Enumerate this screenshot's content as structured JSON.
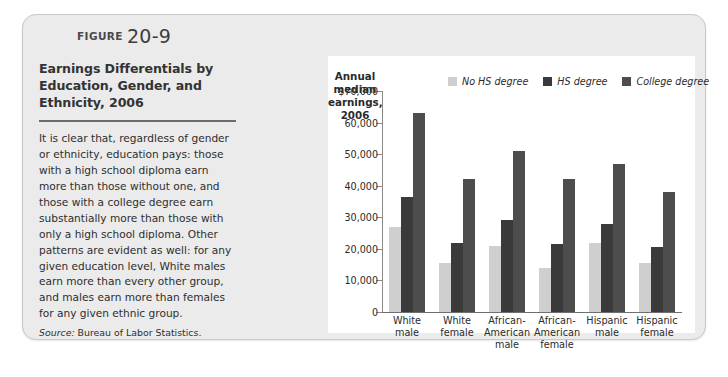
{
  "figure": {
    "label_word": "FIGURE",
    "number": "20-9",
    "title": "Earnings Differentials by Education, Gender, and Ethnicity, 2006",
    "body": "It is clear that, regardless of gender or ethnicity, education pays: those with a high school diploma earn more than those without one, and those with a college degree earn substantially more than those with only a high school diploma. Other patterns are evident as well: for any given education level, White males earn more than every other group, and males earn more than females for any given ethnic group.",
    "source_word": "Source:",
    "source_text": " Bureau of Labor Statistics."
  },
  "chart_data": {
    "type": "bar",
    "title": "",
    "ylabel": "Annual median earnings, 2006",
    "xlabel": "",
    "ylim": [
      0,
      70000
    ],
    "grid": false,
    "legend_position": "top-right",
    "categories": [
      "White male",
      "White female",
      "African-American male",
      "African-American female",
      "Hispanic male",
      "Hispanic female"
    ],
    "category_lines": [
      [
        "White",
        "male"
      ],
      [
        "White",
        "female"
      ],
      [
        "African-",
        "American",
        "male"
      ],
      [
        "African-",
        "American",
        "female"
      ],
      [
        "Hispanic",
        "male"
      ],
      [
        "Hispanic",
        "female"
      ]
    ],
    "series": [
      {
        "name": "No HS degree",
        "color": "#cfcfcf",
        "values": [
          27000,
          15500,
          21000,
          14000,
          22000,
          15500
        ]
      },
      {
        "name": "HS degree",
        "color": "#3a3a3a",
        "values": [
          36500,
          22000,
          29000,
          21500,
          28000,
          20500
        ]
      },
      {
        "name": "College degree",
        "color": "#4d4d4d",
        "values": [
          63000,
          42000,
          51000,
          42000,
          47000,
          38000
        ]
      }
    ],
    "y_ticks": [
      {
        "value": 70000,
        "label": "$70,000"
      },
      {
        "value": 60000,
        "label": "60,000"
      },
      {
        "value": 50000,
        "label": "50,000"
      },
      {
        "value": 40000,
        "label": "40,000"
      },
      {
        "value": 30000,
        "label": "30,000"
      },
      {
        "value": 20000,
        "label": "20,000"
      },
      {
        "value": 10000,
        "label": "10,000"
      },
      {
        "value": 0,
        "label": "0"
      }
    ],
    "axis_title_lines": [
      "Annual",
      "median",
      "earnings,",
      "2006"
    ]
  },
  "colors": {
    "card_bg": "#ebebeb",
    "card_border": "#c8c8c8",
    "panel_bg": "#ffffff",
    "rule": "#6b6b6b",
    "axis": "#8a8a8a",
    "no_hs": "#cfcfcf",
    "hs": "#3a3a3a",
    "college": "#4d4d4d"
  }
}
